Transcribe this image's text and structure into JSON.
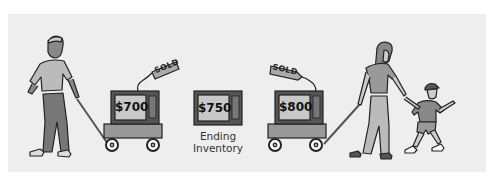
{
  "illustration": {
    "background_color": "#eeeeee",
    "figures": [
      {
        "id": "man",
        "description": "man pulling wagon"
      },
      {
        "id": "woman",
        "description": "woman pulling wagon, holding child's hand"
      },
      {
        "id": "child",
        "description": "child wearing cap"
      }
    ],
    "televisions": [
      {
        "price": "$700",
        "tag": "SOLD",
        "on_wagon": true,
        "pulled_by": "man"
      },
      {
        "price": "$750",
        "caption_line1": "Ending",
        "caption_line2": "Inventory",
        "on_wagon": false
      },
      {
        "price": "$800",
        "tag": "SOLD",
        "on_wagon": true,
        "pulled_by": "woman"
      }
    ]
  }
}
